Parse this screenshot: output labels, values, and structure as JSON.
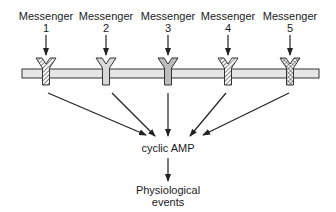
{
  "diagram": {
    "messengers": [
      {
        "label": "Messenger",
        "number": "1",
        "receptor_pattern": "diagonal-hatch"
      },
      {
        "label": "Messenger",
        "number": "2",
        "receptor_pattern": "light-gray"
      },
      {
        "label": "Messenger",
        "number": "3",
        "receptor_pattern": "medium-gray"
      },
      {
        "label": "Messenger",
        "number": "4",
        "receptor_pattern": "diagonal-hatch"
      },
      {
        "label": "Messenger",
        "number": "5",
        "receptor_pattern": "cross-hatch"
      }
    ],
    "membrane": {
      "fill": "#e6e6e6",
      "stroke": "#333333"
    },
    "second_messenger": "cyclic AMP",
    "outcome_line1": "Physiological",
    "outcome_line2": "events",
    "colors": {
      "stroke": "#222222",
      "receptor_light": "#d9d9d9",
      "receptor_medium": "#bdbdbd"
    }
  }
}
